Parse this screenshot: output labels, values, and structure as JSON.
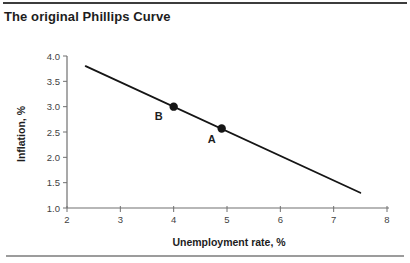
{
  "figure": {
    "title": "The original Phillips Curve"
  },
  "chart_data": {
    "type": "line",
    "title": "The original Phillips Curve",
    "xlabel": "Unemployment rate, %",
    "ylabel": "Inflation, %",
    "xlim": [
      2,
      8
    ],
    "ylim": [
      1.0,
      4.0
    ],
    "x_tick_labels": [
      "2",
      "3",
      "4",
      "5",
      "6",
      "7",
      "8"
    ],
    "y_tick_labels": [
      "4.0",
      "3.5",
      "3.0",
      "2.5",
      "2.0",
      "1.5",
      "1.0"
    ],
    "grid": false,
    "legend": "none",
    "series": [
      {
        "name": "Phillips curve",
        "x": [
          2.35,
          7.5
        ],
        "y": [
          3.8,
          1.3
        ],
        "color": "#151515",
        "stroke_width": 1.8
      }
    ],
    "points": [
      {
        "label": "B",
        "x": 4.0,
        "y": 3.0,
        "label_dx": -15,
        "label_dy": 10,
        "color": "#151515"
      },
      {
        "label": "A",
        "x": 4.9,
        "y": 2.57,
        "label_dx": -10,
        "label_dy": 12,
        "color": "#151515"
      }
    ],
    "colors": {
      "axis": "#707070",
      "tick_label": "#3f3f3f",
      "point_label": "#1d1d1d"
    }
  }
}
